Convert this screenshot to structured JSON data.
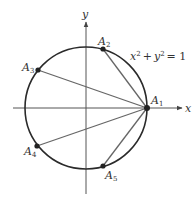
{
  "diagram": {
    "equation_label": "x² + y² = 1",
    "equation": {
      "base_x": "x",
      "plus": "+",
      "base_y": "y",
      "exp": "2",
      "equals": "= 1"
    },
    "axes": {
      "x_label": "x",
      "y_label": "y"
    },
    "points": [
      {
        "name": "A",
        "sub": "1"
      },
      {
        "name": "A",
        "sub": "2"
      },
      {
        "name": "A",
        "sub": "3"
      },
      {
        "name": "A",
        "sub": "4"
      },
      {
        "name": "A",
        "sub": "5"
      }
    ],
    "colors": {
      "circle": "#2a2a2a",
      "chords": "#666666",
      "axes": "#555555",
      "points": "#222222",
      "text": "#333333"
    }
  }
}
